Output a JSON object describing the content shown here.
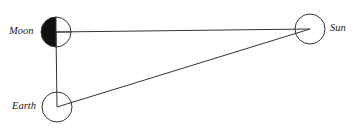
{
  "diagram": {
    "bodies": [
      {
        "name": "Moon",
        "label": "Moon",
        "cx": 56,
        "cy": 32,
        "r": 15,
        "phase": "left half dark"
      },
      {
        "name": "Sun",
        "label": "Sun",
        "cx": 310,
        "cy": 29,
        "r": 15
      },
      {
        "name": "Earth",
        "label": "Earth",
        "cx": 57,
        "cy": 107,
        "r": 15
      }
    ],
    "lines": [
      {
        "from": "Moon",
        "to": "Sun"
      },
      {
        "from": "Moon",
        "to": "Earth"
      },
      {
        "from": "Earth",
        "to": "Sun"
      }
    ],
    "colors": {
      "stroke": "#333333",
      "shade": "#111111",
      "background": "#ffffff"
    }
  }
}
